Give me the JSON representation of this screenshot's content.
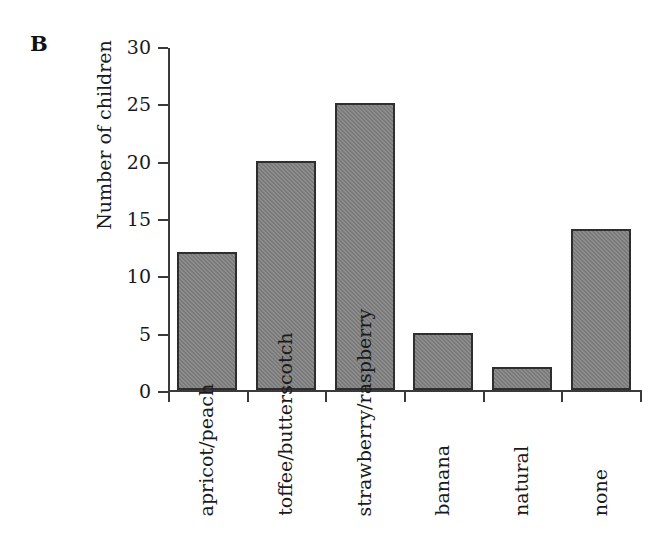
{
  "figure": {
    "panel_label": "B",
    "background_color": "#ffffff"
  },
  "chart_data": {
    "type": "bar",
    "title": "",
    "subtitle": "",
    "panel": "B",
    "xlabel": "",
    "ylabel": "Number of children",
    "categories": [
      "apricot/\npeach",
      "toffee/\nbutterscotch",
      "strawberry/\nraspberry",
      "banana",
      "natural",
      "none"
    ],
    "category_lines": [
      [
        "apricot/",
        "peach"
      ],
      [
        "toffee/",
        "butterscotch"
      ],
      [
        "strawberry/",
        "raspberry"
      ],
      [
        "banana",
        ""
      ],
      [
        "natural",
        ""
      ],
      [
        "none",
        ""
      ]
    ],
    "values": [
      12,
      20,
      25,
      5,
      2,
      14
    ],
    "ylim": [
      0,
      30
    ],
    "ytick_labels": [
      "0",
      "5",
      "10",
      "15",
      "20",
      "25",
      "30"
    ],
    "ytick_values": [
      0,
      5,
      10,
      15,
      20,
      25,
      30
    ],
    "grid": false,
    "legend": null,
    "legend_position": "none",
    "bar_fill_color": "#808080",
    "bar_edge_color": "#2e2e2e",
    "axis_color": "#3a3a3a",
    "tick_direction": "out",
    "annotations": []
  }
}
